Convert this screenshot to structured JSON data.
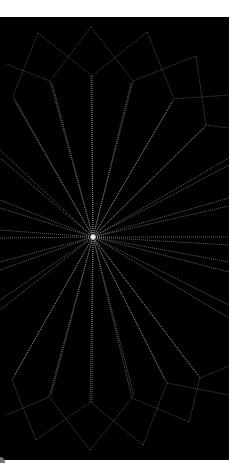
{
  "image": {
    "description": "Abstract white line drawing on black: rays radiating from a central point, framed by a flower/crystal-like outline of polygonal petals at top and bottom",
    "background": "#000000",
    "line_color": "#d8d8d8",
    "frame": {
      "x": 0,
      "y": 17,
      "width": 229,
      "height": 443
    },
    "center": [
      93,
      237
    ],
    "rays": [
      [
        91,
        76
      ],
      [
        92,
        76
      ],
      [
        50,
        81
      ],
      [
        52,
        83
      ],
      [
        133,
        81
      ],
      [
        131,
        83
      ],
      [
        13,
        96
      ],
      [
        14,
        100
      ],
      [
        174,
        99
      ],
      [
        172,
        102
      ],
      [
        206,
        125
      ],
      [
        204,
        128
      ],
      [
        0,
        150
      ],
      [
        0,
        158
      ],
      [
        229,
        158
      ],
      [
        229,
        165
      ],
      [
        0,
        200
      ],
      [
        0,
        208
      ],
      [
        229,
        198
      ],
      [
        229,
        206
      ],
      [
        0,
        230
      ],
      [
        0,
        238
      ],
      [
        229,
        237
      ],
      [
        229,
        245
      ],
      [
        0,
        262
      ],
      [
        0,
        270
      ],
      [
        229,
        262
      ],
      [
        229,
        272
      ],
      [
        0,
        300
      ],
      [
        0,
        310
      ],
      [
        229,
        305
      ],
      [
        229,
        318
      ],
      [
        12,
        380
      ],
      [
        14,
        376
      ],
      [
        49,
        397
      ],
      [
        51,
        395
      ],
      [
        90,
        402
      ],
      [
        92,
        402
      ],
      [
        132,
        398
      ],
      [
        134,
        396
      ],
      [
        167,
        383
      ],
      [
        165,
        380
      ],
      [
        200,
        378
      ],
      [
        198,
        375
      ]
    ],
    "outline": [
      [
        [
          91,
          27
        ],
        [
          50,
          81
        ]
      ],
      [
        [
          91,
          27
        ],
        [
          133,
          81
        ]
      ],
      [
        [
          38,
          33
        ],
        [
          92,
          76
        ]
      ],
      [
        [
          147,
          32
        ],
        [
          92,
          76
        ]
      ],
      [
        [
          38,
          33
        ],
        [
          13,
          96
        ]
      ],
      [
        [
          6,
          64
        ],
        [
          50,
          81
        ]
      ],
      [
        [
          147,
          32
        ],
        [
          174,
          99
        ]
      ],
      [
        [
          196,
          56
        ],
        [
          133,
          81
        ]
      ],
      [
        [
          196,
          56
        ],
        [
          206,
          125
        ]
      ],
      [
        [
          174,
          99
        ],
        [
          229,
          95
        ]
      ],
      [
        [
          206,
          125
        ],
        [
          229,
          128
        ]
      ],
      [
        [
          90,
          450
        ],
        [
          49,
          397
        ]
      ],
      [
        [
          90,
          450
        ],
        [
          132,
          398
        ]
      ],
      [
        [
          36,
          440
        ],
        [
          90,
          402
        ]
      ],
      [
        [
          143,
          445
        ],
        [
          90,
          402
        ]
      ],
      [
        [
          36,
          440
        ],
        [
          12,
          380
        ]
      ],
      [
        [
          6,
          415
        ],
        [
          49,
          397
        ]
      ],
      [
        [
          143,
          445
        ],
        [
          167,
          383
        ]
      ],
      [
        [
          189,
          422
        ],
        [
          132,
          398
        ]
      ],
      [
        [
          189,
          422
        ],
        [
          200,
          378
        ]
      ],
      [
        [
          167,
          383
        ],
        [
          229,
          395
        ]
      ],
      [
        [
          200,
          378
        ],
        [
          229,
          366
        ]
      ]
    ]
  }
}
